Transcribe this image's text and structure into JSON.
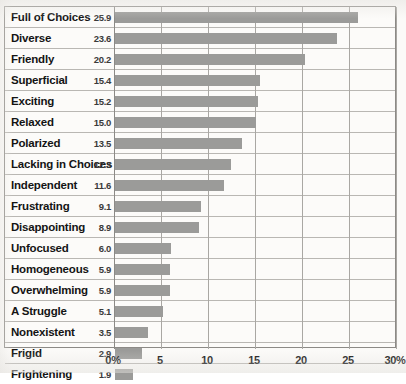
{
  "chart_data": {
    "type": "bar",
    "orientation": "horizontal",
    "title": "",
    "subtitle": "",
    "xlabel": "",
    "ylabel": "",
    "xlim": [
      0,
      30
    ],
    "grid": true,
    "legend": null,
    "value_suffix": "%",
    "tick_labels": [
      "0%",
      "5",
      "10",
      "15",
      "20",
      "25",
      "30%"
    ],
    "ticks": [
      0,
      5,
      10,
      15,
      20,
      25,
      30
    ],
    "categories": [
      "Full of Choices",
      "Diverse",
      "Friendly",
      "Superficial",
      "Exciting",
      "Relaxed",
      "Polarized",
      "Lacking in Choices",
      "Independent",
      "Frustrating",
      "Disappointing",
      "Unfocused",
      "Homogeneous",
      "Overwhelming",
      "A Struggle",
      "Nonexistent",
      "Frigid",
      "Frightening"
    ],
    "values": [
      25.9,
      23.6,
      20.2,
      15.4,
      15.2,
      15.0,
      13.5,
      12.3,
      11.6,
      9.1,
      8.9,
      6.0,
      5.9,
      5.9,
      5.1,
      3.5,
      2.9,
      1.9
    ],
    "value_labels": [
      "25.9",
      "23.6",
      "20.2",
      "15.4",
      "15.2",
      "15.0",
      "13.5",
      "12.3",
      "11.6",
      "9.1",
      "8.9",
      "6.0",
      "5.9",
      "5.9",
      "5.1",
      "3.5",
      "2.9",
      "1.9"
    ],
    "colors": {
      "bar": "#9b9b99",
      "gridline": "#a9a7a3",
      "frame": "#8c8a86",
      "rowline": "#b9b7b3",
      "background": "#fcfbf9",
      "text": "#141414"
    }
  }
}
